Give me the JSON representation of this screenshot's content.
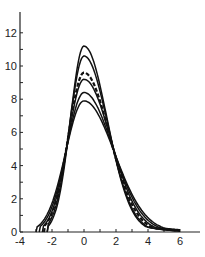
{
  "chart_data": {
    "type": "line",
    "title": "",
    "xlabel": "",
    "ylabel": "",
    "xlim": [
      -4,
      7.3
    ],
    "ylim": [
      0,
      13
    ],
    "grid": false,
    "legend": null,
    "x_ticks": [
      -4,
      -2,
      0,
      2,
      4,
      6
    ],
    "x_minor_ticks": [
      -3,
      -1,
      1,
      3,
      5
    ],
    "y_ticks": [
      0,
      2,
      4,
      6,
      8,
      10,
      12
    ],
    "y_minor_ticks": [
      1,
      3,
      5,
      7,
      9,
      11
    ],
    "x_tick_labels": [
      "-4",
      "-2",
      "0",
      "2",
      "4",
      "6"
    ],
    "y_tick_labels": [
      "0",
      "2",
      "4",
      "6",
      "8",
      "10",
      "12"
    ],
    "series": [
      {
        "name": "curve-1",
        "style": "solid",
        "x_start": -2.3,
        "x_end": 6.0,
        "peak_x": 0.0,
        "peak_y": 11.2,
        "sigma_left": 0.85,
        "sigma_right": 1.45,
        "y_at_6": 0.1
      },
      {
        "name": "curve-2",
        "style": "solid",
        "x_start": -2.3,
        "x_end": 6.0,
        "peak_x": 0.0,
        "peak_y": 10.6,
        "sigma_left": 0.9,
        "sigma_right": 1.5,
        "y_at_6": 0.15
      },
      {
        "name": "curve-3",
        "style": "dashed",
        "x_start": -2.5,
        "x_end": 6.0,
        "peak_x": 0.0,
        "peak_y": 9.6,
        "sigma_left": 0.97,
        "sigma_right": 1.6,
        "y_at_6": 0.2
      },
      {
        "name": "curve-4",
        "style": "solid",
        "x_start": -2.6,
        "x_end": 6.0,
        "peak_x": 0.0,
        "peak_y": 9.2,
        "sigma_left": 1.0,
        "sigma_right": 1.68,
        "y_at_6": 0.25
      },
      {
        "name": "curve-5",
        "style": "solid",
        "x_start": -2.8,
        "x_end": 6.0,
        "peak_x": 0.0,
        "peak_y": 8.4,
        "sigma_left": 1.08,
        "sigma_right": 1.8,
        "y_at_6": 0.35
      },
      {
        "name": "curve-6",
        "style": "solid",
        "x_start": -3.0,
        "x_end": 6.0,
        "peak_x": 0.0,
        "peak_y": 7.9,
        "sigma_left": 1.15,
        "sigma_right": 1.9,
        "y_at_6": 0.45
      }
    ],
    "annotations": [
      {
        "text": "curves intersect near x≈-0.9, y≈6.8"
      },
      {
        "text": "curves intersect near x≈1.5, y≈5.7"
      }
    ]
  },
  "axes": {
    "origin_px": [
      20,
      232
    ],
    "x_px_per_unit": 16.0,
    "y_px_per_unit": 16.6,
    "x_axis_end_px": 200,
    "y_axis_top_px": 12,
    "line_color": "#222222"
  }
}
